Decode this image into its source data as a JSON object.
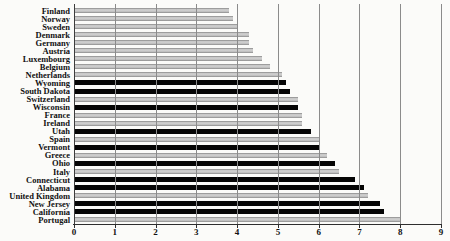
{
  "chart_data": {
    "type": "bar",
    "orientation": "horizontal",
    "title": "",
    "xlabel": "",
    "ylabel": "",
    "xlim": [
      0,
      9
    ],
    "xticks": [
      "0",
      "1",
      "2",
      "3",
      "4",
      "5",
      "6",
      "7",
      "8",
      "9"
    ],
    "grid": "vertical-gridlines-at-integers",
    "legend_position": "none",
    "categories": [
      "Finland",
      "Norway",
      "Sweden",
      "Denmark",
      "Germany",
      "Austria",
      "Luxembourg",
      "Belgium",
      "Netherlands",
      "Wyoming",
      "South Dakota",
      "Switzerland",
      "Wisconsin",
      "France",
      "Ireland",
      "Utah",
      "Spain",
      "Vermont",
      "Greece",
      "Ohio",
      "Italy",
      "Connecticut",
      "Alabama",
      "United Kingdom",
      "New Jersey",
      "California",
      "Portugal"
    ],
    "values": [
      3.8,
      3.9,
      4.0,
      4.3,
      4.3,
      4.4,
      4.6,
      4.8,
      5.1,
      5.2,
      5.3,
      5.5,
      5.5,
      5.6,
      5.6,
      5.8,
      6.0,
      6.0,
      6.2,
      6.4,
      6.5,
      6.9,
      7.1,
      7.2,
      7.5,
      7.6,
      8.0
    ],
    "groups": [
      "country",
      "country",
      "country",
      "country",
      "country",
      "country",
      "country",
      "country",
      "country",
      "us-state",
      "us-state",
      "country",
      "us-state",
      "country",
      "country",
      "us-state",
      "country",
      "us-state",
      "country",
      "us-state",
      "country",
      "us-state",
      "us-state",
      "country",
      "us-state",
      "us-state",
      "country"
    ],
    "colors": {
      "country_bar": "#b5b5b5",
      "us_state_bar": "#050505",
      "gridline": "#8b8b8b",
      "axis": "#2e2e2e",
      "text": "#111111",
      "background": "#fbfbf9"
    }
  }
}
